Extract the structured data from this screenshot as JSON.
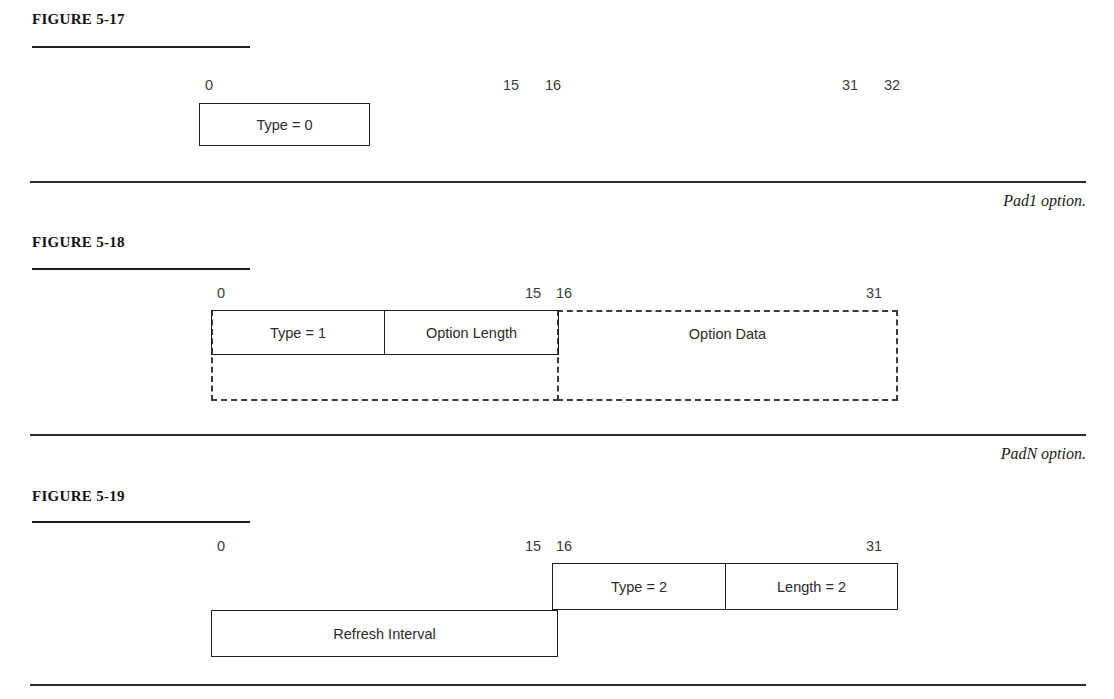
{
  "figures": [
    {
      "id": "fig-5-17",
      "label": "FIGURE 5-17",
      "caption": "Pad1 option.",
      "bit_labels": [
        "0",
        "15",
        "16",
        "31",
        "32"
      ],
      "fields": [
        {
          "name": "type",
          "text": "Type = 0",
          "style": "solid"
        }
      ]
    },
    {
      "id": "fig-5-18",
      "label": "FIGURE 5-18",
      "caption": "PadN option.",
      "bit_labels": [
        "0",
        "15",
        "16",
        "31"
      ],
      "fields": [
        {
          "name": "type",
          "text": "Type = 1",
          "style": "solid"
        },
        {
          "name": "option-length",
          "text": "Option Length",
          "style": "solid"
        },
        {
          "name": "option-data",
          "text": "Option Data",
          "style": "dashed"
        }
      ]
    },
    {
      "id": "fig-5-19",
      "label": "FIGURE 5-19",
      "caption": "",
      "bit_labels": [
        "0",
        "15",
        "16",
        "31"
      ],
      "fields": [
        {
          "name": "type",
          "text": "Type = 2",
          "style": "solid"
        },
        {
          "name": "length",
          "text": "Length = 2",
          "style": "solid"
        },
        {
          "name": "refresh-interval",
          "text": "Refresh Interval",
          "style": "solid"
        }
      ]
    }
  ]
}
